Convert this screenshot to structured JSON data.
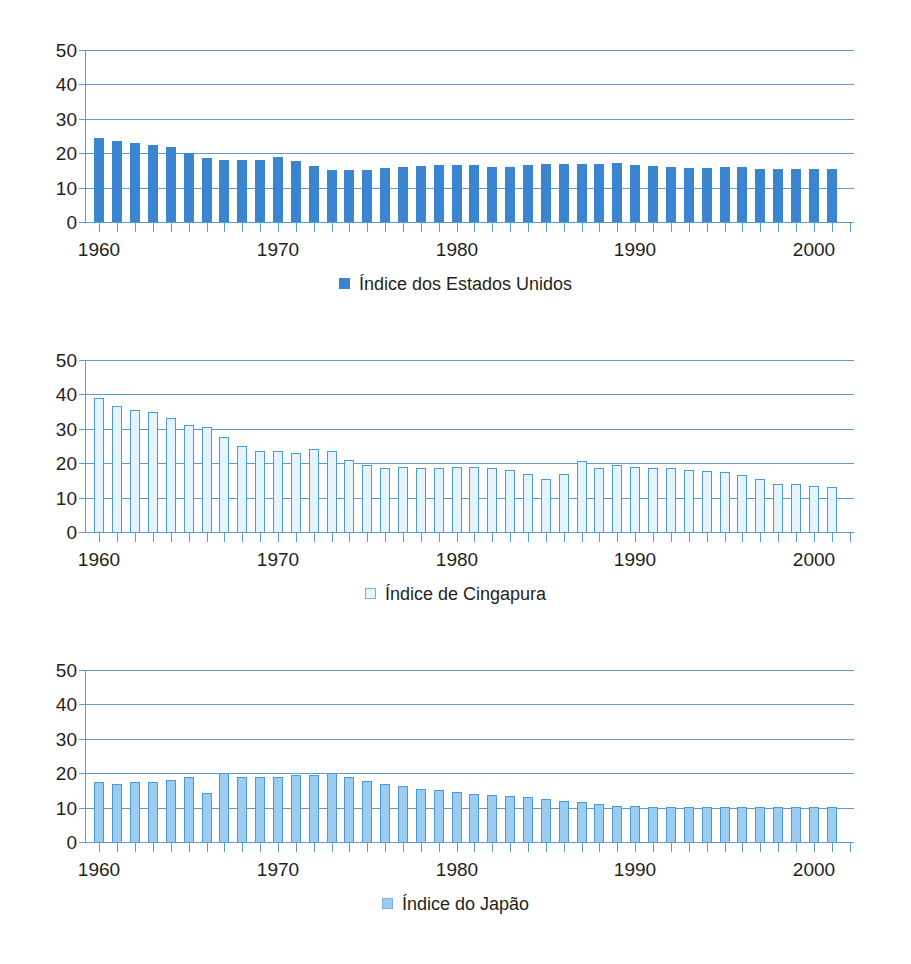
{
  "figure": {
    "panels": [
      {
        "id": "panel-us",
        "legend_label": "Índice dos Estados Unidos",
        "legend_swatch": "filled-square-icon",
        "swatch_color": "#3b85d0"
      },
      {
        "id": "panel-sg",
        "legend_label": "Índice de Cingapura",
        "legend_swatch": "outlined-square-icon",
        "swatch_color": "#eaf6fd"
      },
      {
        "id": "panel-jp",
        "legend_label": "Índice do Japão",
        "legend_swatch": "light-filled-square-icon",
        "swatch_color": "#9ccdf0"
      }
    ]
  },
  "chart_data": [
    {
      "type": "bar",
      "title": "",
      "xlabel": "",
      "ylabel": "",
      "ylim": [
        0,
        50
      ],
      "yticks": [
        0,
        10,
        20,
        30,
        40,
        50
      ],
      "xlim": [
        1960,
        2001
      ],
      "xticks_labeled": [
        1960,
        1970,
        1980,
        1990,
        2000
      ],
      "grid": true,
      "legend": "Índice dos Estados Unidos",
      "legend_position": "bottom-center",
      "series_color": "#3b85d0",
      "x": [
        1960,
        1961,
        1962,
        1963,
        1964,
        1965,
        1966,
        1967,
        1968,
        1969,
        1970,
        1971,
        1972,
        1973,
        1974,
        1975,
        1976,
        1977,
        1978,
        1979,
        1980,
        1981,
        1982,
        1983,
        1984,
        1985,
        1986,
        1987,
        1988,
        1989,
        1990,
        1991,
        1992,
        1993,
        1994,
        1995,
        1996,
        1997,
        1998,
        1999,
        2000,
        2001
      ],
      "values": [
        24.5,
        23.5,
        23,
        22.5,
        21.8,
        20.2,
        18.6,
        17.9,
        17.9,
        17.9,
        19,
        17.6,
        16.3,
        15.2,
        15.1,
        15.2,
        15.7,
        15.9,
        16.2,
        16.6,
        16.6,
        16.5,
        15.9,
        15.9,
        16.5,
        16.9,
        17,
        16.9,
        16.8,
        17.2,
        16.7,
        16.3,
        16,
        15.7,
        15.8,
        15.9,
        15.9,
        15.5,
        15.4,
        15.4,
        15.4,
        15.4
      ]
    },
    {
      "type": "bar",
      "title": "",
      "xlabel": "",
      "ylabel": "",
      "ylim": [
        0,
        50
      ],
      "yticks": [
        0,
        10,
        20,
        30,
        40,
        50
      ],
      "xlim": [
        1960,
        2001
      ],
      "xticks_labeled": [
        1960,
        1970,
        1980,
        1990,
        2000
      ],
      "grid": true,
      "legend": "Índice de Cingapura",
      "legend_position": "bottom-center",
      "series_color": "#e4f3fc",
      "x": [
        1960,
        1961,
        1962,
        1963,
        1964,
        1965,
        1966,
        1967,
        1968,
        1969,
        1970,
        1971,
        1972,
        1973,
        1974,
        1975,
        1976,
        1977,
        1978,
        1979,
        1980,
        1981,
        1982,
        1983,
        1984,
        1985,
        1986,
        1987,
        1988,
        1989,
        1990,
        1991,
        1992,
        1993,
        1994,
        1995,
        1996,
        1997,
        1998,
        1999,
        2000,
        2001
      ],
      "values": [
        39,
        36.5,
        35.5,
        35,
        33,
        31,
        30.5,
        27.5,
        25,
        23.5,
        23.5,
        23,
        24,
        23.5,
        21,
        19.5,
        18.5,
        19,
        18.5,
        18.5,
        19,
        18.8,
        18.5,
        18,
        17,
        15.5,
        17,
        20.5,
        18.5,
        19.5,
        19,
        18.5,
        18.5,
        18,
        17.8,
        17.5,
        16.5,
        15.5,
        14,
        14,
        13.5,
        13
      ]
    },
    {
      "type": "bar",
      "title": "",
      "xlabel": "",
      "ylabel": "",
      "ylim": [
        0,
        50
      ],
      "yticks": [
        0,
        10,
        20,
        30,
        40,
        50
      ],
      "xlim": [
        1960,
        2001
      ],
      "xticks_labeled": [
        1960,
        1970,
        1980,
        1990,
        2000
      ],
      "grid": true,
      "legend": "Índice do Japão",
      "legend_position": "bottom-center",
      "series_color": "#9ccdf0",
      "x": [
        1960,
        1961,
        1962,
        1963,
        1964,
        1965,
        1966,
        1967,
        1968,
        1969,
        1970,
        1971,
        1972,
        1973,
        1974,
        1975,
        1976,
        1977,
        1978,
        1979,
        1980,
        1981,
        1982,
        1983,
        1984,
        1985,
        1986,
        1987,
        1988,
        1989,
        1990,
        1991,
        1992,
        1993,
        1994,
        1995,
        1996,
        1997,
        1998,
        1999,
        2000,
        2001
      ],
      "values": [
        17.5,
        17,
        17.5,
        17.5,
        18,
        19,
        14.2,
        20,
        19,
        19,
        19,
        19.5,
        19.5,
        20,
        19,
        17.8,
        17,
        16.2,
        15.5,
        15,
        14.6,
        14,
        13.6,
        13.3,
        13,
        12.6,
        12,
        11.6,
        11,
        10.6,
        10.4,
        10.3,
        10.3,
        10.3,
        10.3,
        10.3,
        10.2,
        10.2,
        10.2,
        10.2,
        10.2,
        10.2
      ]
    }
  ]
}
